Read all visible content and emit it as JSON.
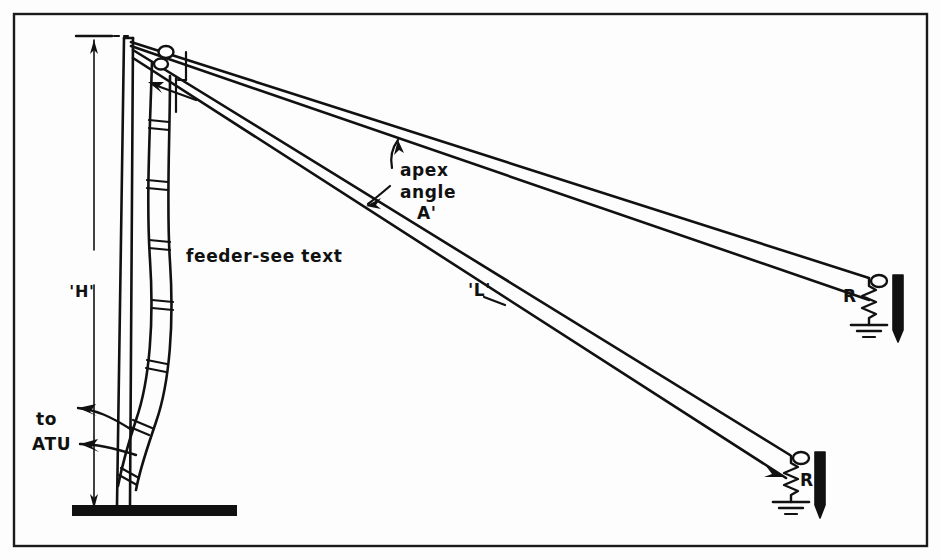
{
  "figure": {
    "background_color": "#fdfdfd",
    "ink_color": "#111111",
    "border_color": "#1a1a1a"
  },
  "labels": {
    "height_dimension": "'H'",
    "feeder": "feeder-see text",
    "apex_angle_line1": "apex",
    "apex_angle_line2": "angle",
    "apex_angle_symbol": "A'",
    "wire_length": "'L'",
    "atu_line1": "to",
    "atu_line2": "ATU",
    "resistor_upper": "R",
    "resistor_lower": "R"
  },
  "components": {
    "mast": "vertical-mast",
    "ground_bar": "ground-plane-bar",
    "feeder_line": "ladder-line-feeder",
    "insulators": [
      "insulator-upper",
      "insulator-lower"
    ],
    "wires": [
      "upper-wire-pair",
      "lower-wire-pair"
    ],
    "terminations": [
      {
        "name": "upper-termination",
        "resistor_label": "R",
        "has_ground_symbol": true,
        "has_support_stake": true
      },
      {
        "name": "lower-termination",
        "resistor_label": "R",
        "has_ground_symbol": true,
        "has_support_stake": true
      }
    ]
  }
}
